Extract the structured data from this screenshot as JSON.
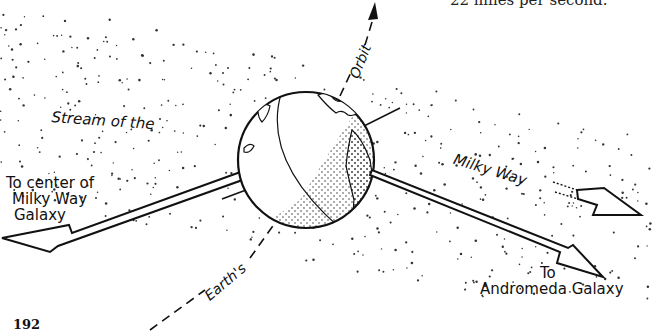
{
  "page": {
    "caption_fragment": "22 miles per second.",
    "page_number": "192"
  },
  "figure": {
    "labels": {
      "to_center": [
        "To center of",
        "Milky Way",
        "Galaxy"
      ],
      "stream_of_the": "Stream of the",
      "milky_way": "Milky Way",
      "orbit": "Orbit",
      "earths": "Earth's",
      "to_andromeda": [
        "To",
        "Andromeda Galaxy"
      ]
    },
    "colors": {
      "ink": "#111111",
      "paper": "#ffffff",
      "stipple": "#333333"
    }
  }
}
